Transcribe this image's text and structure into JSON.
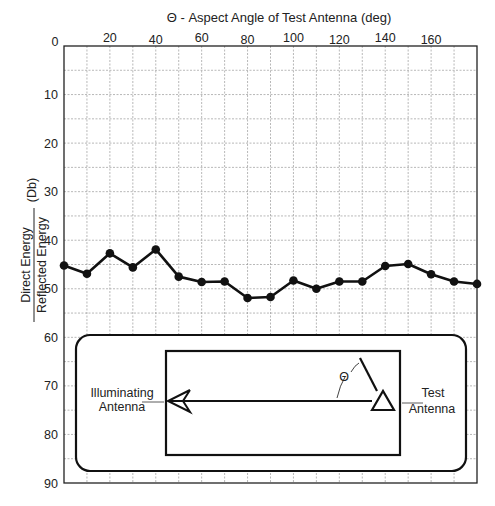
{
  "chart_data": {
    "type": "line",
    "title": "Θ - Aspect Angle of Test Antenna (deg)",
    "xlabel": "Θ - Aspect Angle of Test Antenna (deg)",
    "ylabel": {
      "numerator": "Direct Energy",
      "denominator": "Reflected Energy",
      "unit": "(Db)"
    },
    "xlim": [
      0,
      180
    ],
    "ylim": [
      0,
      90
    ],
    "y_inverted": true,
    "x_axis_position": "top",
    "grid": true,
    "xticks": [
      0,
      20,
      40,
      60,
      80,
      100,
      120,
      140,
      160
    ],
    "xtick_labels": [
      "0",
      "20",
      "40",
      "60",
      "80",
      "100",
      "120",
      "140",
      "160"
    ],
    "yticks": [
      0,
      10,
      20,
      30,
      40,
      50,
      60,
      70,
      80,
      90
    ],
    "ytick_labels": [
      "0",
      "10",
      "20",
      "30",
      "40",
      "50",
      "60",
      "70",
      "80",
      "90"
    ],
    "series": [
      {
        "name": "Direct/Reflected Energy",
        "x": [
          0,
          10,
          20,
          30,
          40,
          50,
          60,
          70,
          80,
          90,
          100,
          110,
          120,
          130,
          140,
          150,
          160,
          170,
          180
        ],
        "values": [
          45.2,
          46.9,
          42.7,
          45.6,
          41.9,
          47.5,
          48.6,
          48.5,
          51.9,
          51.7,
          48.3,
          50.0,
          48.5,
          48.5,
          45.3,
          44.9,
          47.0,
          48.5,
          49.0
        ],
        "color": "#111111",
        "marker": "circle"
      }
    ]
  },
  "inset": {
    "left_label_line1": "Illuminating",
    "left_label_line2": "Antenna",
    "right_label_line1": "Test",
    "right_label_line2": "Antenna",
    "angle_symbol": "Θ"
  }
}
